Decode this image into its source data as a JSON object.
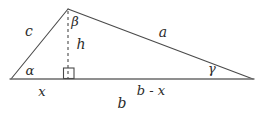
{
  "figure": {
    "kind": "triangle-with-altitude",
    "background_color": "#ffffff",
    "stroke_color": "#4a4a4a",
    "baseline_color": "#6b6b6b",
    "text_color": "#2b2b2b",
    "vertices": {
      "left": {
        "name": "A",
        "x": 11,
        "y": 79
      },
      "apex": {
        "name": "B",
        "x": 68,
        "y": 9
      },
      "right": {
        "name": "C",
        "x": 253,
        "y": 79
      },
      "foot": {
        "name": "H",
        "x": 68,
        "y": 79
      }
    },
    "sides": [
      {
        "id": "c",
        "label": "c",
        "from": "left",
        "to": "apex",
        "label_x": 29,
        "label_y": 31
      },
      {
        "id": "a",
        "label": "a",
        "from": "apex",
        "to": "right",
        "label_x": 163,
        "label_y": 32
      },
      {
        "id": "b",
        "label": "b",
        "from": "left",
        "to": "right",
        "label_x": 122,
        "label_y": 103
      }
    ],
    "angles": [
      {
        "id": "alpha",
        "label": "α",
        "at": "left",
        "label_x": 30,
        "label_y": 70
      },
      {
        "id": "beta",
        "label": "β",
        "at": "apex",
        "label_x": 75,
        "label_y": 21
      },
      {
        "id": "gamma",
        "label": "γ",
        "at": "right",
        "label_x": 212,
        "label_y": 68
      }
    ],
    "altitude": {
      "id": "h",
      "label": "h",
      "style": "dashed",
      "from": "apex",
      "to": "foot",
      "label_x": 81,
      "label_y": 44,
      "right_angle_marker": {
        "name": "right-angle-square",
        "x": 63,
        "y": 68,
        "size": 11
      }
    },
    "segments": [
      {
        "id": "x",
        "label": "x",
        "label_x": 42,
        "label_y": 91
      },
      {
        "id": "b-minus-x",
        "label": "b - x",
        "label_x": 151,
        "label_y": 90
      }
    ]
  }
}
